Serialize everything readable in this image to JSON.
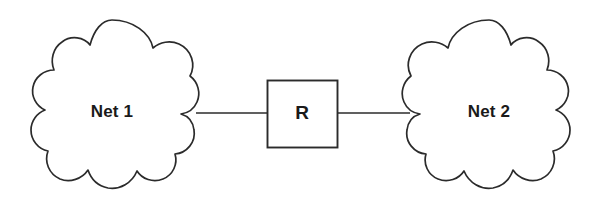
{
  "diagram": {
    "background_color": "#ffffff",
    "stroke_color": "#2b2b2b",
    "label_color": "#1a1a1a",
    "nodes": [
      {
        "id": "net1",
        "shape": "cloud",
        "label": "Net 1",
        "center_x": 112,
        "center_y": 112
      },
      {
        "id": "router",
        "shape": "square",
        "label": "R",
        "center_x": 302,
        "center_y": 114
      },
      {
        "id": "net2",
        "shape": "cloud",
        "label": "Net 2",
        "center_x": 489,
        "center_y": 112
      }
    ],
    "links": [
      {
        "id": "link-net1-router",
        "from": "net1",
        "to": "router",
        "label": "",
        "x1": 196,
        "y1": 113,
        "x2": 267,
        "y2": 113
      },
      {
        "id": "link-router-net2",
        "from": "router",
        "to": "net2",
        "label": "",
        "x1": 338,
        "y1": 113,
        "x2": 409,
        "y2": 113
      }
    ]
  }
}
